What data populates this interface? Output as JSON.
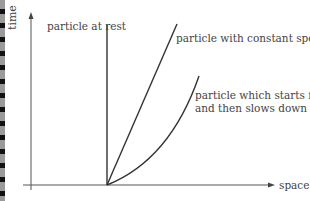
{
  "diagram": {
    "axes": {
      "y_label": "time",
      "x_label": "space"
    },
    "curves": [
      {
        "label": "particle at rest",
        "shape": "vertical line"
      },
      {
        "label": "particle with constant speed",
        "shape": "straight line"
      },
      {
        "label_line1": "particle which starts fast",
        "label_line2": "and then slows down",
        "shape": "curve"
      }
    ],
    "colors": {
      "line": "#333333",
      "axis": "#555555",
      "text": "#444444"
    }
  }
}
